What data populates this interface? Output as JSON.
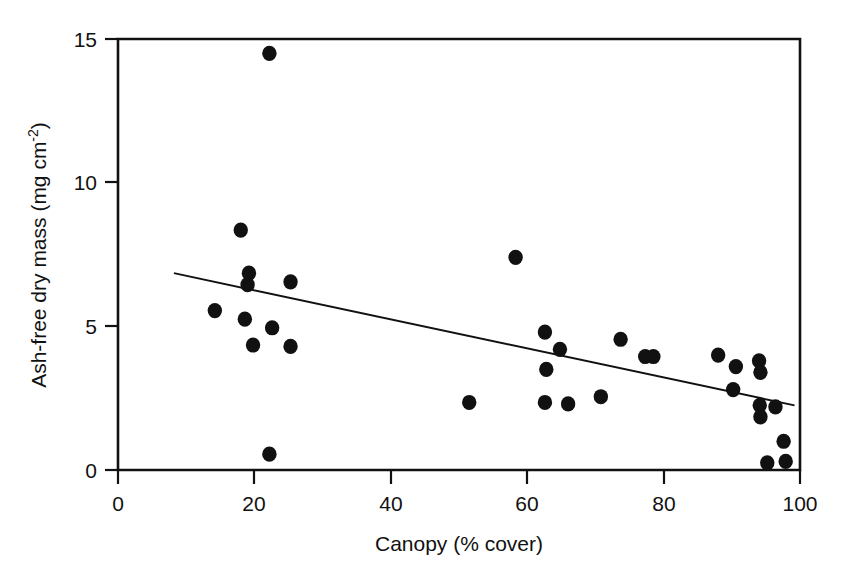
{
  "chart_data": {
    "type": "scatter",
    "title": "",
    "xlabel": "Canopy (% cover)",
    "ylabel_text": "Ash-free dry mass (mg cm",
    "ylabel_sup": "-2",
    "ylabel_tail": ")",
    "ylabel_full": "Ash-free dry mass (mg cm^-2)",
    "xlim": [
      0,
      100
    ],
    "ylim": [
      0,
      15
    ],
    "xticks": [
      0,
      20,
      40,
      60,
      80,
      100
    ],
    "xtick_labels": [
      "0",
      "20",
      "40",
      "60",
      "80",
      "100"
    ],
    "yticks": [
      0,
      5,
      10,
      15
    ],
    "ytick_labels": [
      "0",
      "5",
      "10",
      "15"
    ],
    "grid": false,
    "legend": null,
    "marker": "filled-circle",
    "marker_color": "#111111",
    "axis_color": "#111111",
    "points": [
      {
        "x": 22.2,
        "y": 14.5
      },
      {
        "x": 18.0,
        "y": 8.35
      },
      {
        "x": 19.2,
        "y": 6.85
      },
      {
        "x": 19.0,
        "y": 6.45
      },
      {
        "x": 25.3,
        "y": 6.55
      },
      {
        "x": 14.2,
        "y": 5.55
      },
      {
        "x": 18.6,
        "y": 5.25
      },
      {
        "x": 22.6,
        "y": 4.95
      },
      {
        "x": 19.8,
        "y": 4.35
      },
      {
        "x": 25.3,
        "y": 4.3
      },
      {
        "x": 22.2,
        "y": 0.55
      },
      {
        "x": 51.5,
        "y": 2.35
      },
      {
        "x": 58.3,
        "y": 7.4
      },
      {
        "x": 62.6,
        "y": 4.8
      },
      {
        "x": 64.8,
        "y": 4.2
      },
      {
        "x": 62.8,
        "y": 3.5
      },
      {
        "x": 62.6,
        "y": 2.35
      },
      {
        "x": 66.0,
        "y": 2.3
      },
      {
        "x": 70.8,
        "y": 2.55
      },
      {
        "x": 73.7,
        "y": 4.55
      },
      {
        "x": 77.3,
        "y": 3.95
      },
      {
        "x": 78.5,
        "y": 3.95
      },
      {
        "x": 88.0,
        "y": 4.0
      },
      {
        "x": 90.6,
        "y": 3.6
      },
      {
        "x": 94.0,
        "y": 3.8
      },
      {
        "x": 94.2,
        "y": 3.4
      },
      {
        "x": 90.2,
        "y": 2.8
      },
      {
        "x": 94.1,
        "y": 2.25
      },
      {
        "x": 96.4,
        "y": 2.2
      },
      {
        "x": 94.2,
        "y": 1.85
      },
      {
        "x": 97.6,
        "y": 1.0
      },
      {
        "x": 95.2,
        "y": 0.25
      },
      {
        "x": 97.9,
        "y": 0.3
      }
    ],
    "trend_line": {
      "type": "linear-regression",
      "x_start": 8.2,
      "y_start": 6.85,
      "x_end": 99.2,
      "y_end": 2.25
    }
  }
}
